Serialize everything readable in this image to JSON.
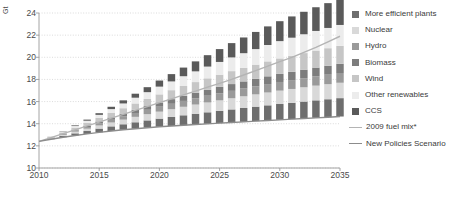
{
  "axis": {
    "y_unit": "Gt",
    "y_ticks": [
      "24",
      "22",
      "20",
      "18",
      "16",
      "14",
      "12",
      "10"
    ],
    "x_ticks": [
      "2010",
      "2015",
      "2020",
      "2025",
      "2030",
      "2035"
    ]
  },
  "legend": {
    "items": [
      {
        "label": "More efficient plants",
        "color": "#6e6e6e",
        "type": "swatch"
      },
      {
        "label": "Nuclear",
        "color": "#d9d9d9",
        "type": "swatch"
      },
      {
        "label": "Hydro",
        "color": "#9a9a9a",
        "type": "swatch"
      },
      {
        "label": "Biomass",
        "color": "#7d7d7d",
        "type": "swatch"
      },
      {
        "label": "Wind",
        "color": "#c6c6c6",
        "type": "swatch"
      },
      {
        "label": "Other renewables",
        "color": "#ececec",
        "type": "swatch"
      },
      {
        "label": "CCS",
        "color": "#5a5a5a",
        "type": "swatch"
      },
      {
        "label": "2009 fuel mix*",
        "color": "#b4b4b4",
        "type": "line"
      },
      {
        "label": "New Policies Scenario",
        "color": "#8c8c8c",
        "type": "line"
      }
    ]
  },
  "chart_data": {
    "type": "bar",
    "stacked": true,
    "title": "",
    "xlabel": "",
    "ylabel": "Gt",
    "xlim": [
      2010,
      2035
    ],
    "ylim": [
      10,
      24
    ],
    "grid": true,
    "legend_position": "right",
    "categories": [
      2011,
      2012,
      2013,
      2014,
      2015,
      2016,
      2017,
      2018,
      2019,
      2020,
      2021,
      2022,
      2023,
      2024,
      2025,
      2026,
      2027,
      2028,
      2029,
      2030,
      2031,
      2032,
      2033,
      2034,
      2035
    ],
    "series": [
      {
        "name": "More efficient plants",
        "color": "#6e6e6e",
        "values": [
          0.06,
          0.12,
          0.19,
          0.26,
          0.34,
          0.42,
          0.5,
          0.58,
          0.66,
          0.74,
          0.82,
          0.9,
          0.97,
          1.04,
          1.11,
          1.18,
          1.25,
          1.31,
          1.37,
          1.43,
          1.48,
          1.53,
          1.58,
          1.62,
          1.66
        ]
      },
      {
        "name": "Nuclear",
        "color": "#d9d9d9",
        "values": [
          0.04,
          0.09,
          0.15,
          0.21,
          0.28,
          0.35,
          0.42,
          0.49,
          0.56,
          0.63,
          0.7,
          0.77,
          0.83,
          0.89,
          0.95,
          1.01,
          1.06,
          1.11,
          1.16,
          1.21,
          1.25,
          1.29,
          1.33,
          1.36,
          1.39
        ]
      },
      {
        "name": "Hydro",
        "color": "#9a9a9a",
        "values": [
          0.03,
          0.07,
          0.11,
          0.15,
          0.2,
          0.25,
          0.3,
          0.35,
          0.4,
          0.45,
          0.49,
          0.53,
          0.57,
          0.61,
          0.64,
          0.67,
          0.7,
          0.73,
          0.76,
          0.78,
          0.8,
          0.82,
          0.84,
          0.86,
          0.88
        ]
      },
      {
        "name": "Biomass",
        "color": "#7d7d7d",
        "values": [
          0.02,
          0.05,
          0.08,
          0.12,
          0.16,
          0.2,
          0.24,
          0.29,
          0.33,
          0.38,
          0.42,
          0.46,
          0.5,
          0.54,
          0.58,
          0.61,
          0.64,
          0.67,
          0.7,
          0.73,
          0.75,
          0.77,
          0.79,
          0.81,
          0.83
        ]
      },
      {
        "name": "Wind",
        "color": "#c6c6c6",
        "values": [
          0.05,
          0.11,
          0.18,
          0.25,
          0.33,
          0.41,
          0.49,
          0.57,
          0.65,
          0.73,
          0.81,
          0.89,
          0.96,
          1.03,
          1.1,
          1.17,
          1.23,
          1.29,
          1.35,
          1.4,
          1.45,
          1.5,
          1.54,
          1.58,
          1.62
        ]
      },
      {
        "name": "Other renewables",
        "color": "#ececec",
        "values": [
          0.03,
          0.08,
          0.14,
          0.2,
          0.27,
          0.35,
          0.43,
          0.52,
          0.61,
          0.7,
          0.79,
          0.88,
          0.97,
          1.06,
          1.15,
          1.24,
          1.32,
          1.4,
          1.48,
          1.56,
          1.63,
          1.7,
          1.77,
          1.83,
          1.89
        ]
      },
      {
        "name": "CCS",
        "color": "#5a5a5a",
        "values": [
          0.01,
          0.03,
          0.06,
          0.1,
          0.15,
          0.21,
          0.28,
          0.36,
          0.45,
          0.55,
          0.66,
          0.78,
          0.9,
          1.03,
          1.16,
          1.29,
          1.42,
          1.55,
          1.68,
          1.8,
          1.92,
          2.03,
          2.14,
          2.24,
          2.33
        ]
      }
    ],
    "lines": [
      {
        "name": "2009 fuel mix*",
        "color": "#b4b4b4",
        "x": [
          2010,
          2011,
          2012,
          2013,
          2014,
          2015,
          2016,
          2017,
          2018,
          2019,
          2020,
          2021,
          2022,
          2023,
          2024,
          2025,
          2026,
          2027,
          2028,
          2029,
          2030,
          2031,
          2032,
          2033,
          2034,
          2035
        ],
        "y": [
          12.4,
          12.75,
          13.1,
          13.45,
          13.8,
          14.15,
          14.5,
          14.85,
          15.2,
          15.55,
          15.9,
          16.25,
          16.6,
          16.95,
          17.3,
          17.65,
          18.0,
          18.4,
          18.8,
          19.2,
          19.6,
          20.0,
          20.45,
          20.9,
          21.4,
          21.9
        ]
      },
      {
        "name": "New Policies Scenario",
        "color": "#8c8c8c",
        "x": [
          2010,
          2011,
          2012,
          2013,
          2014,
          2015,
          2016,
          2017,
          2018,
          2019,
          2020,
          2021,
          2022,
          2023,
          2024,
          2025,
          2026,
          2027,
          2028,
          2029,
          2030,
          2031,
          2032,
          2033,
          2034,
          2035
        ],
        "y": [
          12.4,
          12.6,
          12.78,
          12.94,
          13.08,
          13.22,
          13.34,
          13.45,
          13.55,
          13.64,
          13.72,
          13.79,
          13.86,
          13.93,
          13.99,
          14.05,
          14.11,
          14.17,
          14.23,
          14.29,
          14.35,
          14.41,
          14.47,
          14.53,
          14.59,
          14.65
        ]
      }
    ]
  }
}
